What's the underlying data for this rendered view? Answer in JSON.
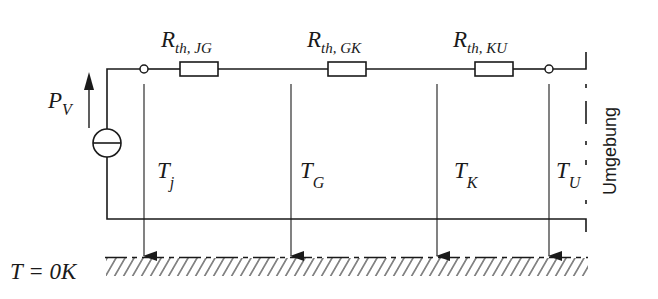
{
  "diagram": {
    "type": "thermal equivalent circuit",
    "source": {
      "label_main": "P",
      "label_sub": "V",
      "symbol": "current-source-icon"
    },
    "resistors": [
      {
        "id": "jg",
        "label_main": "R",
        "label_sub": "th, JG"
      },
      {
        "id": "gk",
        "label_main": "R",
        "label_sub": "th, GK"
      },
      {
        "id": "ku",
        "label_main": "R",
        "label_sub": "th, KU"
      }
    ],
    "temperatures": [
      {
        "id": "j",
        "label_main": "T",
        "label_sub": "j"
      },
      {
        "id": "g",
        "label_main": "T",
        "label_sub": "G"
      },
      {
        "id": "k",
        "label_main": "T",
        "label_sub": "K"
      },
      {
        "id": "u",
        "label_main": "T",
        "label_sub": "U"
      }
    ],
    "reference": {
      "label": "T = 0K"
    },
    "boundary": {
      "label": "Umgebung"
    },
    "colors": {
      "line": "#1a1a1a",
      "background": "#ffffff"
    }
  }
}
